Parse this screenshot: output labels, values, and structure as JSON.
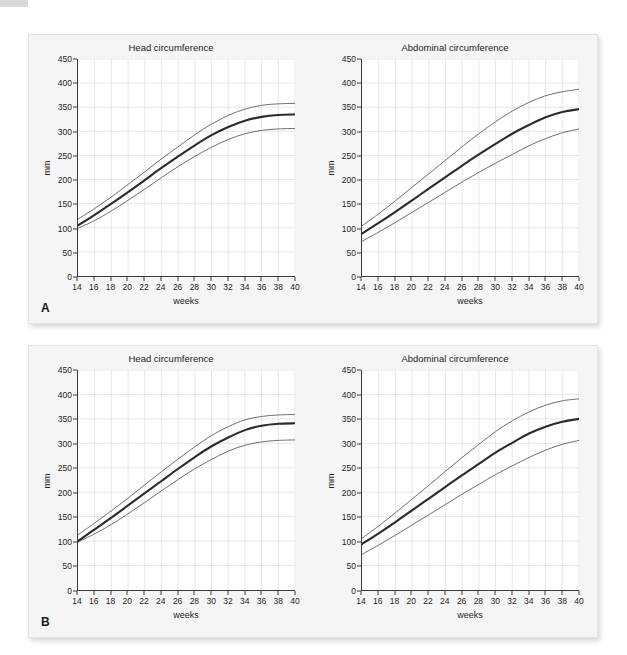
{
  "figure": {
    "panels": [
      {
        "letter": "A",
        "charts": [
          {
            "key": "a-head",
            "title": "Head circumference",
            "xlabel": "weeks",
            "ylabel": "mm"
          },
          {
            "key": "a-abdo",
            "title": "Abdominal circumference",
            "xlabel": "weeks",
            "ylabel": "mm"
          }
        ]
      },
      {
        "letter": "B",
        "charts": [
          {
            "key": "b-head",
            "title": "Head circumference",
            "xlabel": "weeks",
            "ylabel": "mm"
          },
          {
            "key": "b-abdo",
            "title": "Abdominal circumference",
            "xlabel": "weeks",
            "ylabel": "mm"
          }
        ]
      }
    ]
  },
  "axes": {
    "yticks": [
      0,
      50,
      100,
      150,
      200,
      250,
      300,
      350,
      400,
      450
    ],
    "xticks": [
      14,
      16,
      18,
      20,
      22,
      24,
      26,
      28,
      30,
      32,
      34,
      36,
      38,
      40
    ],
    "xlim": [
      14,
      40
    ],
    "ylim": [
      0,
      450
    ],
    "grid": true
  },
  "colors": {
    "median_line": "#2b2b2b",
    "percentile_line": "#555555",
    "grid": "#c9c9d2",
    "axis": "#3a3a3a",
    "marker": "#3a3a3a",
    "card_bg": "#f5f5f5",
    "plot_bg": "#ffffff",
    "corner_bar": "#d8d9db"
  },
  "chart_data": [
    {
      "id": "a-head",
      "type": "line",
      "title": "Head circumference",
      "xlabel": "weeks",
      "ylabel": "mm",
      "xlim": [
        14,
        40
      ],
      "ylim": [
        0,
        450
      ],
      "grid": true,
      "legend": "none",
      "x": [
        14,
        16,
        18,
        20,
        22,
        24,
        26,
        28,
        30,
        32,
        34,
        36,
        38,
        40
      ],
      "series": [
        {
          "name": "upper reference limit",
          "style": "thin",
          "values": [
            118,
            140,
            164,
            190,
            216,
            243,
            268,
            293,
            315,
            333,
            346,
            354,
            357,
            358
          ]
        },
        {
          "name": "median",
          "style": "thick",
          "values": [
            105,
            127,
            150,
            174,
            199,
            224,
            248,
            271,
            292,
            309,
            322,
            330,
            334,
            335
          ]
        },
        {
          "name": "lower reference limit",
          "style": "thin",
          "values": [
            99,
            115,
            135,
            157,
            180,
            204,
            227,
            248,
            267,
            283,
            295,
            302,
            305,
            306
          ]
        }
      ],
      "points": {
        "name": "measurements",
        "marker": "plus",
        "x": [
          20,
          25,
          30,
          35
        ],
        "y": [
          172,
          228,
          287,
          318
        ]
      }
    },
    {
      "id": "a-abdo",
      "type": "line",
      "title": "Abdominal circumference",
      "xlabel": "weeks",
      "ylabel": "mm",
      "xlim": [
        14,
        40
      ],
      "ylim": [
        0,
        450
      ],
      "grid": true,
      "legend": "none",
      "x": [
        14,
        16,
        18,
        20,
        22,
        24,
        26,
        28,
        30,
        32,
        34,
        36,
        38,
        40
      ],
      "series": [
        {
          "name": "upper reference limit",
          "style": "thin",
          "values": [
            104,
            129,
            156,
            184,
            212,
            240,
            268,
            295,
            320,
            342,
            360,
            374,
            382,
            387
          ]
        },
        {
          "name": "median",
          "style": "thick",
          "values": [
            88,
            110,
            133,
            157,
            181,
            205,
            229,
            252,
            274,
            295,
            313,
            329,
            340,
            346
          ]
        },
        {
          "name": "lower reference limit",
          "style": "thin",
          "values": [
            72,
            91,
            111,
            132,
            153,
            174,
            195,
            215,
            234,
            252,
            270,
            285,
            297,
            305
          ]
        }
      ],
      "points": {
        "name": "measurements",
        "marker": "plus",
        "x": [
          20,
          25,
          30,
          35
        ],
        "y": [
          150,
          194,
          236,
          273
        ]
      }
    },
    {
      "id": "b-head",
      "type": "line",
      "title": "Head circumference",
      "xlabel": "weeks",
      "ylabel": "mm",
      "xlim": [
        14,
        40
      ],
      "ylim": [
        0,
        450
      ],
      "grid": true,
      "legend": "none",
      "x": [
        14,
        16,
        18,
        20,
        22,
        24,
        26,
        28,
        30,
        32,
        34,
        36,
        38,
        40
      ],
      "series": [
        {
          "name": "upper reference limit",
          "style": "thin",
          "values": [
            113,
            137,
            162,
            188,
            215,
            242,
            268,
            293,
            316,
            334,
            348,
            355,
            358,
            359
          ]
        },
        {
          "name": "median",
          "style": "thick",
          "values": [
            100,
            124,
            148,
            173,
            198,
            223,
            248,
            272,
            294,
            312,
            327,
            336,
            340,
            341
          ]
        },
        {
          "name": "lower reference limit",
          "style": "thin",
          "values": [
            98,
            115,
            134,
            156,
            179,
            203,
            226,
            248,
            267,
            284,
            296,
            303,
            306,
            307
          ]
        }
      ],
      "points": {
        "name": "measurements",
        "marker": "plus",
        "x": [
          20,
          25,
          30,
          35
        ],
        "y": [
          155,
          210,
          262,
          297
        ]
      }
    },
    {
      "id": "b-abdo",
      "type": "line",
      "title": "Abdominal circumference",
      "xlabel": "weeks",
      "ylabel": "mm",
      "xlim": [
        14,
        40
      ],
      "ylim": [
        0,
        450
      ],
      "grid": true,
      "legend": "none",
      "x": [
        14,
        16,
        18,
        20,
        22,
        24,
        26,
        28,
        30,
        32,
        34,
        36,
        38,
        40
      ],
      "series": [
        {
          "name": "upper reference limit",
          "style": "thin",
          "values": [
            106,
            131,
            158,
            186,
            214,
            243,
            271,
            298,
            324,
            346,
            364,
            378,
            387,
            391
          ]
        },
        {
          "name": "median",
          "style": "thick",
          "values": [
            94,
            116,
            139,
            163,
            187,
            211,
            235,
            258,
            281,
            301,
            320,
            334,
            344,
            350
          ]
        },
        {
          "name": "lower reference limit",
          "style": "thin",
          "values": [
            73,
            92,
            112,
            133,
            154,
            175,
            196,
            216,
            236,
            254,
            271,
            286,
            298,
            306
          ]
        }
      ],
      "points": {
        "name": "measurements",
        "marker": "plus",
        "x": [
          20,
          25,
          30,
          35
        ],
        "y": [
          134,
          183,
          233,
          277
        ]
      }
    }
  ]
}
